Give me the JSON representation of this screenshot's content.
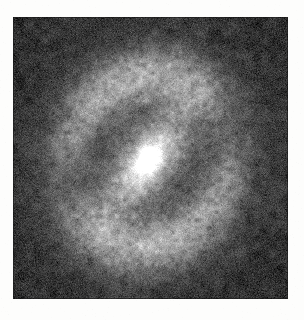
{
  "page": {
    "background_color": "#fdfdfc",
    "width": 304,
    "height": 320,
    "caption": ""
  },
  "plate": {
    "label": "",
    "x": 13,
    "y": 17,
    "width": 275,
    "height": 282,
    "background_color": "#3c3c3c",
    "border_color": "#1a1a1a",
    "colormap": "grayscale",
    "sky_level_hex": "#3a3a3a",
    "peak_level_hex": "#f2f2f0"
  },
  "chart_data": {
    "type": "heatmap",
    "title": "",
    "subtitle": "",
    "xlabel": "",
    "ylabel": "",
    "legend": [],
    "annotations": [],
    "grid": false,
    "colormap": "gray",
    "axis_ranges": {
      "x": [
        0,
        275
      ],
      "y": [
        0,
        282
      ]
    },
    "value_range": [
      0,
      1
    ],
    "object_class": "barred ringed spiral galaxy",
    "components": [
      {
        "name": "sky-background",
        "kind": "uniform",
        "level": 0.175,
        "noise_sigma": 0.045
      },
      {
        "name": "outer-halo",
        "kind": "gaussian-ellipse",
        "cx": 135,
        "cy": 145,
        "rx": 104,
        "ry": 112,
        "angle_deg": 30,
        "amplitude": 0.085
      },
      {
        "name": "outer-ring",
        "kind": "elliptical-ring",
        "cx": 134,
        "cy": 144,
        "rx": 82,
        "ry": 92,
        "angle_deg": 28,
        "thickness": 30,
        "amplitude": 0.17,
        "azimuthal_modulation": [
          {
            "angle_deg": 40,
            "gain": 1.55,
            "span_deg": 78
          },
          {
            "angle_deg": 215,
            "gain": 1.45,
            "span_deg": 80
          },
          {
            "angle_deg": 135,
            "gain": 0.62,
            "span_deg": 62
          },
          {
            "angle_deg": 330,
            "gain": 0.58,
            "span_deg": 58
          }
        ]
      },
      {
        "name": "inner-bar",
        "kind": "gaussian-ellipse",
        "cx": 134,
        "cy": 144,
        "rx": 62,
        "ry": 25,
        "angle_deg": -55,
        "amplitude": 0.47
      },
      {
        "name": "bar-wide-envelope",
        "kind": "gaussian-ellipse",
        "cx": 132,
        "cy": 146,
        "rx": 74,
        "ry": 40,
        "angle_deg": -52,
        "amplitude": 0.2
      },
      {
        "name": "nucleus",
        "kind": "gaussian-ellipse",
        "cx": 135,
        "cy": 143,
        "rx": 16,
        "ry": 12,
        "angle_deg": -55,
        "amplitude": 0.52
      },
      {
        "name": "arm-northeast",
        "kind": "arc",
        "cx": 134,
        "cy": 144,
        "rx": 76,
        "ry": 84,
        "angle_deg": 28,
        "start_deg": -12,
        "end_deg": 96,
        "thickness": 24,
        "amplitude": 0.2
      },
      {
        "name": "arm-southwest",
        "kind": "arc",
        "cx": 134,
        "cy": 144,
        "rx": 76,
        "ry": 84,
        "angle_deg": 28,
        "start_deg": 168,
        "end_deg": 276,
        "thickness": 24,
        "amplitude": 0.2
      },
      {
        "name": "dust-lane-east",
        "kind": "dark-patch",
        "cx": 196,
        "cy": 168,
        "rx": 34,
        "ry": 44,
        "angle_deg": 12,
        "amplitude": -0.05
      },
      {
        "name": "dust-lane-west",
        "kind": "dark-patch",
        "cx": 74,
        "cy": 120,
        "rx": 30,
        "ry": 40,
        "angle_deg": -10,
        "amplitude": -0.045
      },
      {
        "name": "film-grain",
        "kind": "noise",
        "sigma": 0.052,
        "correlation_px": 1.6
      }
    ],
    "features": {
      "bar_position_angle_deg": 55,
      "bar_length_px": 124,
      "ring_major_axis_px": 182,
      "ring_minor_axis_px": 164,
      "nucleus_center_px": [
        148,
        160
      ],
      "brightest_value": 0.97
    }
  }
}
